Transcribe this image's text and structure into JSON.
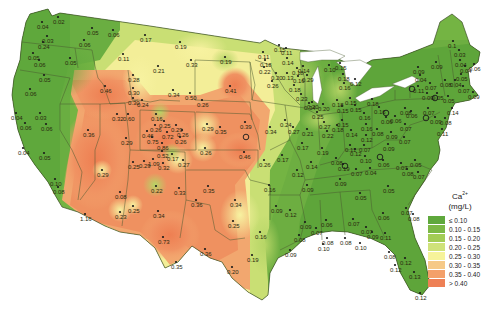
{
  "legend": {
    "title_base": "Ca",
    "title_sup": "2+",
    "units": "(mg/L)",
    "bins": [
      {
        "label": "≤ 0.10",
        "color": "#5fa83c"
      },
      {
        "label": "0.10 - 0.15",
        "color": "#7cb845"
      },
      {
        "label": "0.15 - 0.20",
        "color": "#a3cc55"
      },
      {
        "label": "0.20 - 0.25",
        "color": "#cfe27a"
      },
      {
        "label": "0.25 - 0.30",
        "color": "#f6f39a"
      },
      {
        "label": "0.30 - 0.35",
        "color": "#f6c987"
      },
      {
        "label": "0.35 - 0.40",
        "color": "#f4a06a"
      },
      {
        "label": "> 0.40",
        "color": "#ee8055"
      }
    ]
  },
  "map": {
    "region": "Contiguous United States",
    "variable": "Ca2+ concentration (mg/L)",
    "points": [
      {
        "x": 42,
        "y": 22,
        "v": "0.04"
      },
      {
        "x": 58,
        "y": 17,
        "v": "0.02"
      },
      {
        "x": 47,
        "y": 36,
        "v": "0.03"
      },
      {
        "x": 43,
        "y": 42,
        "v": "0.24"
      },
      {
        "x": 33,
        "y": 53,
        "v": "0.05"
      },
      {
        "x": 39,
        "y": 60,
        "v": "0.06"
      },
      {
        "x": 44,
        "y": 75,
        "v": "0.05"
      },
      {
        "x": 30,
        "y": 89,
        "v": "0.06"
      },
      {
        "x": 70,
        "y": 58,
        "v": "0.05"
      },
      {
        "x": 84,
        "y": 40,
        "v": "0.06"
      },
      {
        "x": 92,
        "y": 28,
        "v": "0.05"
      },
      {
        "x": 113,
        "y": 30,
        "v": "0.06"
      },
      {
        "x": 145,
        "y": 35,
        "v": "0.17"
      },
      {
        "x": 123,
        "y": 54,
        "v": "0.11"
      },
      {
        "x": 158,
        "y": 66,
        "v": "0.21"
      },
      {
        "x": 180,
        "y": 42,
        "v": "0.19"
      },
      {
        "x": 105,
        "y": 86,
        "v": "0.46"
      },
      {
        "x": 133,
        "y": 75,
        "v": "0.28"
      },
      {
        "x": 133,
        "y": 88,
        "v": "0.30"
      },
      {
        "x": 133,
        "y": 98,
        "v": "0.30"
      },
      {
        "x": 142,
        "y": 100,
        "v": "0.24"
      },
      {
        "x": 173,
        "y": 90,
        "v": "0.34"
      },
      {
        "x": 190,
        "y": 93,
        "v": "0.50"
      },
      {
        "x": 202,
        "y": 100,
        "v": "0.26"
      },
      {
        "x": 191,
        "y": 60,
        "v": "0.33"
      },
      {
        "x": 225,
        "y": 57,
        "v": "0.19"
      },
      {
        "x": 230,
        "y": 86,
        "v": "0.41"
      },
      {
        "x": 263,
        "y": 52,
        "v": "0.11"
      },
      {
        "x": 16,
        "y": 113,
        "v": "0.04"
      },
      {
        "x": 40,
        "y": 113,
        "v": "0.03"
      },
      {
        "x": 25,
        "y": 123,
        "v": "0.06"
      },
      {
        "x": 46,
        "y": 124,
        "v": "0.06"
      },
      {
        "x": 23,
        "y": 148,
        "v": "0.04"
      },
      {
        "x": 44,
        "y": 153,
        "v": "0.05"
      },
      {
        "x": 55,
        "y": 179,
        "v": "0.10"
      },
      {
        "x": 58,
        "y": 187,
        "v": "0.08"
      },
      {
        "x": 88,
        "y": 130,
        "v": "0.36"
      },
      {
        "x": 102,
        "y": 170,
        "v": "0.29"
      },
      {
        "x": 120,
        "y": 192,
        "v": "0.08"
      },
      {
        "x": 117,
        "y": 114,
        "v": "0.32"
      },
      {
        "x": 128,
        "y": 114,
        "v": "0.60"
      },
      {
        "x": 126,
        "y": 138,
        "v": "0.29"
      },
      {
        "x": 156,
        "y": 114,
        "v": "0.16"
      },
      {
        "x": 164,
        "y": 121,
        "v": "0.25"
      },
      {
        "x": 155,
        "y": 125,
        "v": "0.26"
      },
      {
        "x": 176,
        "y": 125,
        "v": "0.29"
      },
      {
        "x": 147,
        "y": 131,
        "v": "0.46"
      },
      {
        "x": 167,
        "y": 132,
        "v": "0.72"
      },
      {
        "x": 182,
        "y": 130,
        "v": "0.26"
      },
      {
        "x": 152,
        "y": 137,
        "v": "0.75"
      },
      {
        "x": 180,
        "y": 137,
        "v": "0.26"
      },
      {
        "x": 162,
        "y": 143,
        "v": "0.86"
      },
      {
        "x": 172,
        "y": 154,
        "v": "0.17"
      },
      {
        "x": 162,
        "y": 151,
        "v": "0.52"
      },
      {
        "x": 144,
        "y": 161,
        "v": "0.29"
      },
      {
        "x": 133,
        "y": 162,
        "v": "0.25"
      },
      {
        "x": 153,
        "y": 159,
        "v": "1.09"
      },
      {
        "x": 163,
        "y": 163,
        "v": "0.32"
      },
      {
        "x": 183,
        "y": 160,
        "v": "0.27"
      },
      {
        "x": 207,
        "y": 124,
        "v": "0.29"
      },
      {
        "x": 205,
        "y": 148,
        "v": "0.26"
      },
      {
        "x": 156,
        "y": 186,
        "v": "0.22"
      },
      {
        "x": 220,
        "y": 127,
        "v": "0.35"
      },
      {
        "x": 245,
        "y": 122,
        "v": "0.39"
      },
      {
        "x": 244,
        "y": 152,
        "v": "0.46"
      },
      {
        "x": 270,
        "y": 127,
        "v": "0.34"
      },
      {
        "x": 264,
        "y": 160,
        "v": "0.26"
      },
      {
        "x": 285,
        "y": 120,
        "v": "0.24"
      },
      {
        "x": 179,
        "y": 188,
        "v": "0.33"
      },
      {
        "x": 208,
        "y": 186,
        "v": "0.35"
      },
      {
        "x": 85,
        "y": 214,
        "v": "1.16"
      },
      {
        "x": 120,
        "y": 212,
        "v": "0.23"
      },
      {
        "x": 133,
        "y": 206,
        "v": "0.25"
      },
      {
        "x": 158,
        "y": 211,
        "v": "0.34"
      },
      {
        "x": 163,
        "y": 237,
        "v": "0.73"
      },
      {
        "x": 176,
        "y": 262,
        "v": "0.35"
      },
      {
        "x": 196,
        "y": 200,
        "v": "0.36"
      },
      {
        "x": 235,
        "y": 200,
        "v": "0.34"
      },
      {
        "x": 233,
        "y": 221,
        "v": "0.25"
      },
      {
        "x": 205,
        "y": 249,
        "v": "0.36"
      },
      {
        "x": 260,
        "y": 232,
        "v": "0.16"
      },
      {
        "x": 252,
        "y": 255,
        "v": "0.19"
      },
      {
        "x": 232,
        "y": 267,
        "v": "0.20"
      },
      {
        "x": 276,
        "y": 206,
        "v": "0.09"
      },
      {
        "x": 290,
        "y": 210,
        "v": "0.12"
      },
      {
        "x": 279,
        "y": 45,
        "v": "0.15"
      },
      {
        "x": 286,
        "y": 48,
        "v": "0.11"
      },
      {
        "x": 287,
        "y": 58,
        "v": "0.14"
      },
      {
        "x": 265,
        "y": 60,
        "v": "0.18"
      },
      {
        "x": 264,
        "y": 67,
        "v": "0.22"
      },
      {
        "x": 276,
        "y": 73,
        "v": "0.20"
      },
      {
        "x": 272,
        "y": 81,
        "v": "0.26"
      },
      {
        "x": 287,
        "y": 73,
        "v": "0.13"
      },
      {
        "x": 297,
        "y": 68,
        "v": "0.18"
      },
      {
        "x": 298,
        "y": 76,
        "v": "0.16"
      },
      {
        "x": 307,
        "y": 75,
        "v": "0.29"
      },
      {
        "x": 303,
        "y": 66,
        "v": "0.14"
      },
      {
        "x": 294,
        "y": 85,
        "v": "0.18"
      },
      {
        "x": 301,
        "y": 94,
        "v": "0.23"
      },
      {
        "x": 309,
        "y": 103,
        "v": "0.34"
      },
      {
        "x": 312,
        "y": 102,
        "v": "0.20"
      },
      {
        "x": 329,
        "y": 65,
        "v": "0.10"
      },
      {
        "x": 340,
        "y": 63,
        "v": "0.15"
      },
      {
        "x": 343,
        "y": 74,
        "v": "0.18"
      },
      {
        "x": 342,
        "y": 106,
        "v": "0.15"
      },
      {
        "x": 355,
        "y": 105,
        "v": "0.15"
      },
      {
        "x": 323,
        "y": 104,
        "v": "0.20"
      },
      {
        "x": 317,
        "y": 112,
        "v": "0.25"
      },
      {
        "x": 344,
        "y": 83,
        "v": "0.16"
      },
      {
        "x": 355,
        "y": 79,
        "v": "0.12"
      },
      {
        "x": 350,
        "y": 98,
        "v": "0.15"
      },
      {
        "x": 337,
        "y": 100,
        "v": "0.18"
      },
      {
        "x": 293,
        "y": 127,
        "v": "0.27"
      },
      {
        "x": 307,
        "y": 129,
        "v": "0.21"
      },
      {
        "x": 327,
        "y": 131,
        "v": "0.22"
      },
      {
        "x": 337,
        "y": 125,
        "v": "0.18"
      },
      {
        "x": 324,
        "y": 122,
        "v": "0.27"
      },
      {
        "x": 302,
        "y": 143,
        "v": "0.17"
      },
      {
        "x": 282,
        "y": 155,
        "v": "0.17"
      },
      {
        "x": 322,
        "y": 148,
        "v": "0.19"
      },
      {
        "x": 311,
        "y": 162,
        "v": "0.14"
      },
      {
        "x": 297,
        "y": 170,
        "v": "0.12"
      },
      {
        "x": 307,
        "y": 185,
        "v": "0.09"
      },
      {
        "x": 269,
        "y": 185,
        "v": "0.16"
      },
      {
        "x": 336,
        "y": 158,
        "v": "0.08"
      },
      {
        "x": 343,
        "y": 164,
        "v": "0.19"
      },
      {
        "x": 356,
        "y": 169,
        "v": "0.07"
      },
      {
        "x": 340,
        "y": 179,
        "v": "0.09"
      },
      {
        "x": 342,
        "y": 120,
        "v": "0.15"
      },
      {
        "x": 351,
        "y": 130,
        "v": "0.14"
      },
      {
        "x": 350,
        "y": 145,
        "v": "0.11"
      },
      {
        "x": 355,
        "y": 149,
        "v": "0.12"
      },
      {
        "x": 366,
        "y": 124,
        "v": "0.16"
      },
      {
        "x": 366,
        "y": 135,
        "v": "0.12"
      },
      {
        "x": 364,
        "y": 145,
        "v": "0.07"
      },
      {
        "x": 365,
        "y": 156,
        "v": "0.10"
      },
      {
        "x": 386,
        "y": 117,
        "v": "0.06"
      },
      {
        "x": 395,
        "y": 116,
        "v": "0.06"
      },
      {
        "x": 379,
        "y": 107,
        "v": "0.16"
      },
      {
        "x": 372,
        "y": 99,
        "v": "0.18"
      },
      {
        "x": 364,
        "y": 113,
        "v": "0.16"
      },
      {
        "x": 377,
        "y": 129,
        "v": "0.08"
      },
      {
        "x": 391,
        "y": 132,
        "v": "0.09"
      },
      {
        "x": 388,
        "y": 144,
        "v": "0.09"
      },
      {
        "x": 405,
        "y": 124,
        "v": "0.07"
      },
      {
        "x": 404,
        "y": 137,
        "v": "0.07"
      },
      {
        "x": 383,
        "y": 160,
        "v": "0.06"
      },
      {
        "x": 370,
        "y": 168,
        "v": "0.04"
      },
      {
        "x": 401,
        "y": 163,
        "v": "0.07"
      },
      {
        "x": 407,
        "y": 169,
        "v": "0.08"
      },
      {
        "x": 415,
        "y": 160,
        "v": "0.05"
      },
      {
        "x": 418,
        "y": 172,
        "v": "0.07"
      },
      {
        "x": 388,
        "y": 186,
        "v": "0.05"
      },
      {
        "x": 360,
        "y": 193,
        "v": "0.05"
      },
      {
        "x": 406,
        "y": 208,
        "v": "0.07"
      },
      {
        "x": 383,
        "y": 213,
        "v": "0.06"
      },
      {
        "x": 413,
        "y": 214,
        "v": "0.08"
      },
      {
        "x": 366,
        "y": 227,
        "v": "0.07"
      },
      {
        "x": 360,
        "y": 243,
        "v": "0.10"
      },
      {
        "x": 372,
        "y": 232,
        "v": "0.09"
      },
      {
        "x": 385,
        "y": 233,
        "v": "0.11"
      },
      {
        "x": 389,
        "y": 252,
        "v": "0.08"
      },
      {
        "x": 395,
        "y": 265,
        "v": "0.12"
      },
      {
        "x": 405,
        "y": 258,
        "v": "0.12"
      },
      {
        "x": 414,
        "y": 272,
        "v": "0.13"
      },
      {
        "x": 420,
        "y": 293,
        "v": "0.12"
      },
      {
        "x": 305,
        "y": 222,
        "v": "0.09"
      },
      {
        "x": 316,
        "y": 228,
        "v": "0.07"
      },
      {
        "x": 326,
        "y": 220,
        "v": "0.06"
      },
      {
        "x": 299,
        "y": 235,
        "v": "0.08"
      },
      {
        "x": 290,
        "y": 250,
        "v": "0.09"
      },
      {
        "x": 323,
        "y": 244,
        "v": "0.10"
      },
      {
        "x": 327,
        "y": 238,
        "v": "0.08"
      },
      {
        "x": 345,
        "y": 238,
        "v": "0.08"
      },
      {
        "x": 353,
        "y": 219,
        "v": "0.07"
      },
      {
        "x": 418,
        "y": 67,
        "v": "0.09"
      },
      {
        "x": 436,
        "y": 62,
        "v": "0.09"
      },
      {
        "x": 453,
        "y": 41,
        "v": "0.1"
      },
      {
        "x": 459,
        "y": 50,
        "v": "0.03"
      },
      {
        "x": 460,
        "y": 60,
        "v": "0.04"
      },
      {
        "x": 465,
        "y": 66,
        "v": "0.04"
      },
      {
        "x": 474,
        "y": 64,
        "v": "0.06"
      },
      {
        "x": 461,
        "y": 74,
        "v": "0.05"
      },
      {
        "x": 455,
        "y": 80,
        "v": "0.04"
      },
      {
        "x": 420,
        "y": 75,
        "v": "0.04"
      },
      {
        "x": 430,
        "y": 83,
        "v": "0.07"
      },
      {
        "x": 445,
        "y": 80,
        "v": "0.08"
      },
      {
        "x": 463,
        "y": 86,
        "v": "0.07"
      },
      {
        "x": 473,
        "y": 92,
        "v": "0.09"
      },
      {
        "x": 418,
        "y": 86,
        "v": "0.11"
      },
      {
        "x": 427,
        "y": 93,
        "v": "0.09"
      },
      {
        "x": 437,
        "y": 93,
        "v": "0.05"
      },
      {
        "x": 448,
        "y": 96,
        "v": "0.05"
      },
      {
        "x": 452,
        "y": 108,
        "v": "0.14"
      },
      {
        "x": 428,
        "y": 108,
        "v": "0.07"
      },
      {
        "x": 435,
        "y": 117,
        "v": "0.09"
      },
      {
        "x": 445,
        "y": 118,
        "v": "0.08"
      },
      {
        "x": 442,
        "y": 129,
        "v": "0.11"
      },
      {
        "x": 405,
        "y": 108,
        "v": "0.08"
      },
      {
        "x": 411,
        "y": 111,
        "v": "0.06"
      }
    ],
    "highlight_sites": [
      {
        "x": 246,
        "y": 137
      },
      {
        "x": 345,
        "y": 166
      },
      {
        "x": 412,
        "y": 89
      },
      {
        "x": 380,
        "y": 157
      },
      {
        "x": 426,
        "y": 118
      },
      {
        "x": 386,
        "y": 113
      },
      {
        "x": 435,
        "y": 98
      }
    ]
  }
}
